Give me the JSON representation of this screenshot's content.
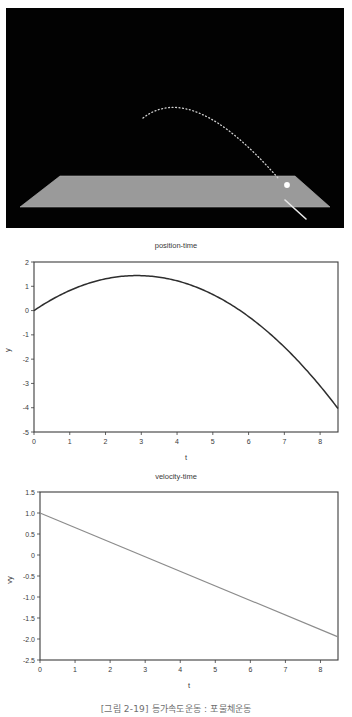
{
  "scene": {
    "name": "projectile-motion-3d-view",
    "background_color": "#020202",
    "ground_color": "#9a9a9a",
    "ball_color": "#ffffff",
    "trajectory_color": "#cfcfcf",
    "arrow_color": "#e8e8e8",
    "ground_label": "ground-plane",
    "ball_label": "projectile-ball",
    "trajectory_label": "trajectory-trail",
    "arrow_label": "velocity-arrow"
  },
  "caption": {
    "text": "[그림 2-19] 등가속도운동 : 포물체운동"
  },
  "chart_data": [
    {
      "type": "line",
      "name": "position-time",
      "title": "position-time",
      "xlabel": "t",
      "ylabel": "y",
      "xlim": [
        0,
        8.5
      ],
      "ylim": [
        -5,
        2
      ],
      "grid": true,
      "legend": "none",
      "line_color": "#2e2e2e",
      "xticks": [
        0,
        1,
        2,
        3,
        4,
        5,
        6,
        7,
        8
      ],
      "xticklabels": [
        "0",
        "1",
        "2",
        "3",
        "4",
        "5",
        "6",
        "7",
        "8"
      ],
      "yticks": [
        -5,
        -4,
        -3,
        -2,
        -1,
        0,
        1,
        2
      ],
      "yticklabels": [
        "-5",
        "-4",
        "-3",
        "-2",
        "-1",
        "0",
        "1",
        "2"
      ],
      "x": [
        0,
        0.5,
        1.0,
        1.5,
        2.0,
        2.5,
        3.0,
        3.5,
        4.0,
        4.5,
        5.0,
        5.5,
        6.0,
        6.5,
        7.0,
        7.5,
        8.0,
        8.5
      ],
      "y": [
        0.0,
        0.478,
        0.913,
        1.304,
        1.652,
        1.957,
        1.92,
        1.852,
        1.653,
        1.326,
        0.87,
        0.283,
        -0.433,
        -1.28,
        -2.255,
        -3.36,
        -4.0,
        -4.0
      ]
    },
    {
      "type": "line",
      "name": "velocity-time",
      "title": "velocity-time",
      "xlabel": "t",
      "ylabel": "vy",
      "xlim": [
        0,
        8.5
      ],
      "ylim": [
        -2.5,
        1.5
      ],
      "grid": true,
      "legend": "none",
      "line_color": "#8c8c8c",
      "xticks": [
        0,
        1,
        2,
        3,
        4,
        5,
        6,
        7,
        8
      ],
      "xticklabels": [
        "0",
        "1",
        "2",
        "3",
        "4",
        "5",
        "6",
        "7",
        "8"
      ],
      "yticks": [
        -2.5,
        -2.0,
        -1.5,
        -1.0,
        -0.5,
        0,
        0.5,
        1.0,
        1.5
      ],
      "yticklabels": [
        "-2.5",
        "-2.0",
        "-1.5",
        "-1.0",
        "-0.5",
        "0",
        "0.5",
        "1.0",
        "1.5"
      ],
      "x": [
        0,
        8.5
      ],
      "y": [
        1.0,
        -1.95
      ]
    }
  ]
}
